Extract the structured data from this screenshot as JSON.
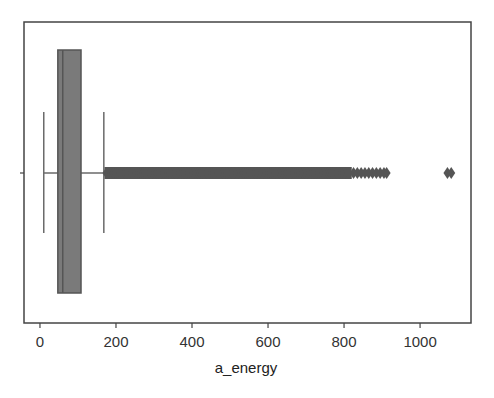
{
  "chart_data": {
    "type": "box",
    "orientation": "horizontal",
    "title": "",
    "xlabel": "a_energy",
    "ylabel": "",
    "xlim": [
      -42,
      1134
    ],
    "xticks": [
      0,
      200,
      400,
      600,
      800,
      1000
    ],
    "xtick_labels": [
      "0",
      "200",
      "400",
      "600",
      "800",
      "1000"
    ],
    "grid": false,
    "legend": null,
    "series": [
      {
        "name": "a_energy",
        "whisker_low": 10,
        "q1": 47,
        "median": 60,
        "q3": 108,
        "whisker_high": 168,
        "outliers_dense_range": [
          175,
          815
        ],
        "outliers_sparse": [
          825,
          835,
          845,
          855,
          865,
          875,
          885,
          895,
          905,
          912
        ],
        "outliers_far": [
          1072,
          1082
        ]
      }
    ]
  },
  "colors": {
    "box_fill": "#7a7a7a",
    "box_edge": "#555555",
    "whisker": "#6a6a6a",
    "outlier": "#555555",
    "frame": "#444444"
  }
}
